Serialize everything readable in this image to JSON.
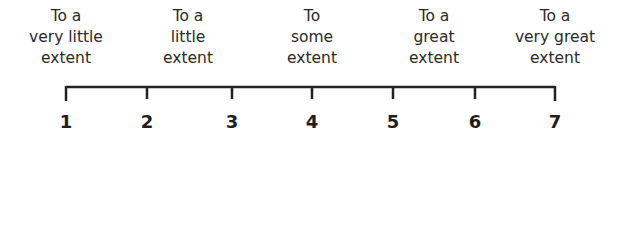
{
  "scale": {
    "points": [
      {
        "value": "1",
        "label": "To a\nvery little\nextent",
        "x": 66
      },
      {
        "value": "2",
        "label": "To a\nlittle\nextent",
        "x": 147
      },
      {
        "value": "3",
        "label": "",
        "x": 232
      },
      {
        "value": "4",
        "label": "To\nsome\nextent",
        "x": 312
      },
      {
        "value": "5",
        "label": "To a\ngreat\nextent",
        "x": 393
      },
      {
        "value": "6",
        "label": "",
        "x": 475
      },
      {
        "value": "7",
        "label": "To a\nvery great\nextent",
        "x": 555
      }
    ],
    "line_color": "#222222"
  }
}
